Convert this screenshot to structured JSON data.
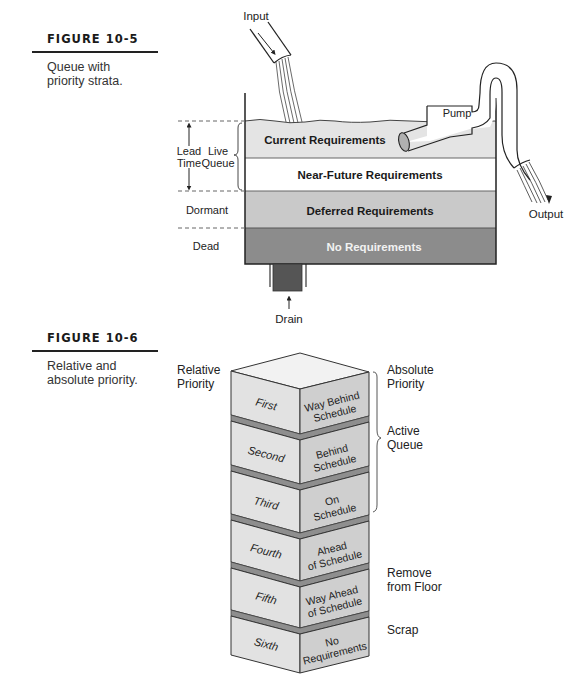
{
  "figures": [
    {
      "id": "10-5",
      "title": "FIGURE 10-5",
      "caption_lines": [
        "Queue with",
        "priority strata."
      ],
      "diagram": {
        "input_label": "Input",
        "pump_label": "Pump",
        "output_label": "Output",
        "drain_label": "Drain",
        "left_labels": {
          "lead_time": [
            "Lead",
            "Time"
          ],
          "live_queue": [
            "Live",
            "Queue"
          ],
          "dormant": "Dormant",
          "dead": "Dead"
        },
        "layers": [
          {
            "label": "Current Requirements",
            "color": "#e4e4e4",
            "text_color": "#1a1a1a"
          },
          {
            "label": "Near-Future Requirements",
            "color": "#ffffff",
            "text_color": "#1a1a1a"
          },
          {
            "label": "Deferred Requirements",
            "color": "#c9c9c9",
            "text_color": "#1a1a1a"
          },
          {
            "label": "No Requirements",
            "color": "#8c8c8c",
            "text_color": "#f2f2f2"
          }
        ]
      }
    },
    {
      "id": "10-6",
      "title": "FIGURE 10-6",
      "caption_lines": [
        "Relative and",
        "absolute priority."
      ],
      "diagram": {
        "relative_header": [
          "Relative",
          "Priority"
        ],
        "absolute_header": [
          "Absolute",
          "Priority"
        ],
        "blocks": [
          {
            "relative": "First",
            "absolute": [
              "Way Behind",
              "Schedule"
            ]
          },
          {
            "relative": "Second",
            "absolute": [
              "Behind",
              "Schedule"
            ]
          },
          {
            "relative": "Third",
            "absolute": [
              "On",
              "Schedule"
            ]
          },
          {
            "relative": "Fourth",
            "absolute": [
              "Ahead",
              "of Schedule"
            ]
          },
          {
            "relative": "Fifth",
            "absolute": [
              "Way Ahead",
              "of Schedule"
            ]
          },
          {
            "relative": "Sixth",
            "absolute": [
              "No",
              "Requirements"
            ]
          }
        ],
        "groups": [
          {
            "label": [
              "Active",
              "Queue"
            ]
          },
          {
            "label": [
              "Remove",
              "from Floor"
            ]
          },
          {
            "label": [
              "Scrap"
            ]
          }
        ],
        "colors": {
          "front": "#e2e2e2",
          "side": "#cfcfcf",
          "top": "#f2f2f2",
          "gap": "#8e8e8e"
        }
      }
    }
  ]
}
